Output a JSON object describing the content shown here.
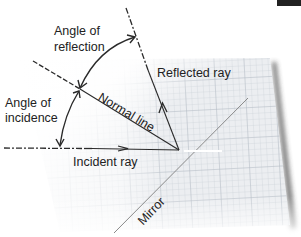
{
  "diagram": {
    "type": "law-of-reflection",
    "labels": {
      "angle_of_reflection": [
        "Angle of",
        "reflection"
      ],
      "angle_of_incidence": [
        "Angle of",
        "incidence"
      ],
      "reflected_ray": "Reflected ray",
      "normal_line": "Normal line",
      "incident_ray": "Incident ray",
      "mirror": "Mirror"
    },
    "colors": {
      "line": "#2a2a2a",
      "mirror": "#8a8a8a",
      "grid": "#c9cfd6",
      "paper": "#eef0f2",
      "highlight": "#ffffff"
    }
  }
}
